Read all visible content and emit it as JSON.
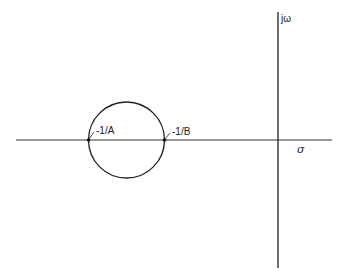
{
  "diagram": {
    "type": "complex-plane-plot",
    "axes": {
      "vertical_label": "jω",
      "horizontal_label": "σ"
    },
    "circle": {
      "description": "circle on negative real axis",
      "left_point_label": "-1/A",
      "right_point_label": "-1/B"
    },
    "colors": {
      "stroke": "#222222",
      "background": "#ffffff"
    }
  }
}
